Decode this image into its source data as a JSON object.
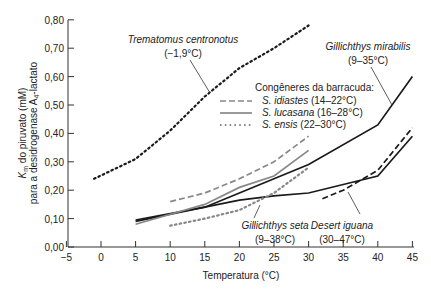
{
  "chart_data": {
    "type": "line",
    "title": "",
    "xlabel": "Temperatura (°C)",
    "ylabel_line1": "Km do piruvato (mM)",
    "ylabel_line2": "para a desidrogenase A4-lactato",
    "xlim": [
      -5,
      45
    ],
    "ylim": [
      0,
      0.8
    ],
    "x_ticks": [
      -5,
      0,
      5,
      10,
      15,
      20,
      25,
      30,
      35,
      40,
      45
    ],
    "x_tick_labels": [
      "−5",
      "0",
      "5",
      "10",
      "15",
      "20",
      "25",
      "30",
      "35",
      "40",
      "45"
    ],
    "y_ticks": [
      0,
      0.1,
      0.2,
      0.3,
      0.4,
      0.5,
      0.6,
      0.7,
      0.8
    ],
    "y_tick_labels": [
      "0,00",
      "0,10",
      "0,20",
      "0,30",
      "0,40",
      "0,50",
      "0,60",
      "0,70",
      "0,80"
    ],
    "grid": false,
    "series": [
      {
        "name": "Trematomus centronotus (−1,9°C)",
        "style": "dotted",
        "color": "#1a1a1a",
        "x": [
          -1,
          5,
          10,
          15,
          20,
          25,
          30
        ],
        "values": [
          0.24,
          0.31,
          0.41,
          0.53,
          0.63,
          0.7,
          0.78
        ]
      },
      {
        "name": "Gillichthys mirabilis (9–35°C)",
        "style": "solid",
        "color": "#1a1a1a",
        "x": [
          5,
          15,
          20,
          25,
          30,
          40,
          45
        ],
        "values": [
          0.095,
          0.14,
          0.19,
          0.24,
          0.29,
          0.43,
          0.6
        ]
      },
      {
        "name": "Gillichthys seta (9–38°C)",
        "style": "solid",
        "color": "#1a1a1a",
        "x": [
          5,
          15,
          20,
          25,
          30,
          35,
          40,
          45
        ],
        "values": [
          0.09,
          0.14,
          0.165,
          0.18,
          0.19,
          0.22,
          0.25,
          0.39
        ]
      },
      {
        "name": "Desert iguana (30–47°C)",
        "style": "dashed",
        "color": "#1a1a1a",
        "x": [
          32,
          35,
          40,
          45
        ],
        "values": [
          0.17,
          0.2,
          0.27,
          0.42
        ]
      },
      {
        "name": "S. idiastes (14–22°C)",
        "style": "dashed",
        "color": "#888888",
        "x": [
          10,
          15,
          20,
          25,
          30
        ],
        "values": [
          0.16,
          0.19,
          0.24,
          0.3,
          0.39
        ]
      },
      {
        "name": "S. lucasana (16–28°C)",
        "style": "solid",
        "color": "#888888",
        "x": [
          5,
          15,
          20,
          25,
          30
        ],
        "values": [
          0.08,
          0.15,
          0.21,
          0.25,
          0.34
        ]
      },
      {
        "name": "S. ensis (22–30°C)",
        "style": "dotted",
        "color": "#888888",
        "x": [
          10,
          15,
          20,
          25,
          30
        ],
        "values": [
          0.075,
          0.1,
          0.13,
          0.19,
          0.28
        ]
      }
    ],
    "annotations": [
      {
        "text": "Trematomus centronotus",
        "sub": "(−1,9°C)"
      },
      {
        "text": "Gillichthys mirabilis",
        "sub": "(9–35°C)"
      },
      {
        "text": "Gillichthys seta",
        "sub": "(9–38°C)"
      },
      {
        "text": "Desert iguana",
        "sub": "(30–47°C)"
      }
    ],
    "legend": {
      "title": "Congêneres da barracuda:",
      "position": "upper-center",
      "entries": [
        {
          "species": "S. idiastes",
          "range": "(14–22°C)",
          "style": "dashed"
        },
        {
          "species": "S. lucasana",
          "range": "(16–28°C)",
          "style": "solid"
        },
        {
          "species": "S. ensis",
          "range": "(22–30°C)",
          "style": "dotted"
        }
      ]
    }
  }
}
